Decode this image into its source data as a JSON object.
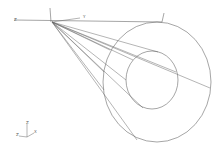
{
  "viewport": {
    "type": "3d-wireframe",
    "background": "#ffffff",
    "line_color": "#6a6a6a"
  },
  "local_axes": {
    "left_label": "Z",
    "right_label": "Y"
  },
  "triad": {
    "up_label": "Z",
    "left_label": "Z",
    "right_label": "X"
  },
  "geometry": {
    "apex": [
      52,
      22
    ],
    "outer_ellipse": {
      "cx": 157,
      "cy": 82,
      "rx": 54,
      "ry": 60
    },
    "inner_ellipse": {
      "cx": 152,
      "cy": 80,
      "rx": 26,
      "ry": 29
    }
  }
}
